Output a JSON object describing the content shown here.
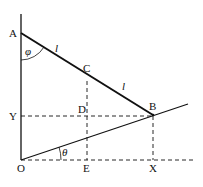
{
  "diagram": {
    "points": {
      "A": "A",
      "C": "C",
      "B": "B",
      "D": "D",
      "Y": "Y",
      "O": "O",
      "E": "E",
      "X": "X"
    },
    "segment_labels": {
      "AC": "l",
      "CB": "l"
    },
    "angles": {
      "phi": "φ",
      "theta": "θ"
    },
    "colors": {
      "line": "#111111",
      "background": "#ffffff"
    }
  }
}
